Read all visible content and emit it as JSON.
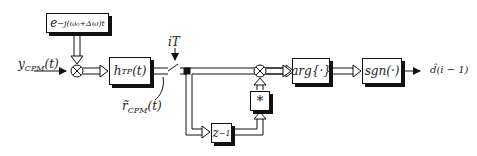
{
  "diagram": {
    "blocks": {
      "mixer_exp": {
        "label": "e",
        "sup": "−j(ω₀+Δω)t"
      },
      "lowpass": {
        "label": "h",
        "sub": "TP",
        "arg": "(t)"
      },
      "delay": {
        "label": "z",
        "sup": "−1"
      },
      "conjugate": {
        "label": "*"
      },
      "arg": {
        "label": "arg{·}"
      },
      "sgn": {
        "label": "sgn(·)"
      }
    },
    "labels": {
      "input": "y",
      "input_sub": "CPM",
      "input_arg": "(t)",
      "sampler": "iT",
      "sampled": "r̃",
      "sampled_sub": "CPM",
      "sampled_arg": "(t)",
      "output": "d̂(i − 1)"
    },
    "colors": {
      "line": "#111111",
      "background": "#ffffff"
    }
  }
}
